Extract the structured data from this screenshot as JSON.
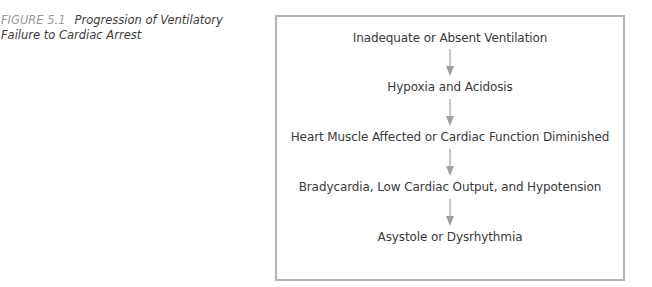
{
  "caption": {
    "label": "FIGURE 5.1",
    "title": "Progression of Ventilatory Failure to Cardiac Arrest"
  },
  "flowchart": {
    "steps": [
      "Inadequate or Absent Ventilation",
      "Hypoxia and Acidosis",
      "Heart Muscle Affected or Cardiac Function Diminished",
      "Bradycardia, Low Cardiac Output, and Hypotension",
      "Asystole or Dysrhythmia"
    ],
    "arrow_icon": "arrow-down-icon",
    "colors": {
      "border": "#b4b4b4",
      "arrow": "#a0a0a0",
      "text": "#3a3a3a",
      "caption_label": "#9a9a9a"
    }
  }
}
